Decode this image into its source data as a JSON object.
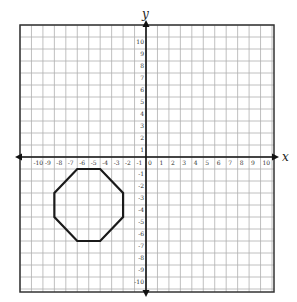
{
  "axes": {
    "x_label": "x",
    "y_label": "y",
    "x_ticks": [
      "-10",
      "-9",
      "-8",
      "-7",
      "-6",
      "-5",
      "-4",
      "-3",
      "-2",
      "-1",
      "0",
      "1",
      "2",
      "3",
      "4",
      "5",
      "6",
      "7",
      "8",
      "9",
      "10"
    ],
    "y_ticks": [
      "10",
      "9",
      "8",
      "7",
      "6",
      "5",
      "4",
      "3",
      "2",
      "1",
      "-1",
      "-2",
      "-3",
      "-4",
      "-5",
      "-6",
      "-7",
      "-8",
      "-9",
      "-10"
    ],
    "x_range": [
      -11,
      11
    ],
    "y_range": [
      -11,
      11
    ]
  },
  "shape": {
    "type": "octagon",
    "vertices": [
      [
        -6,
        -1
      ],
      [
        -4,
        -1
      ],
      [
        -2,
        -3
      ],
      [
        -2,
        -5
      ],
      [
        -4,
        -7
      ],
      [
        -6,
        -7
      ],
      [
        -8,
        -5
      ],
      [
        -8,
        -3
      ]
    ],
    "stroke": "#1a1a1a"
  },
  "colors": {
    "grid": "#b0b0b0",
    "axis": "#111111",
    "border": "#333333"
  }
}
